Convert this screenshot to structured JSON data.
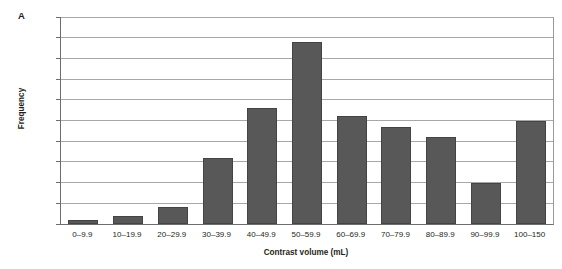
{
  "panel": {
    "letter": "A"
  },
  "chart_data": {
    "type": "bar",
    "title": "",
    "xlabel": "Contrast volume (mL)",
    "ylabel": "Frequency",
    "categories": [
      "0–9.9",
      "10–19.9",
      "20–29.9",
      "30–39.9",
      "40–49.9",
      "50–59.9",
      "60–69.9",
      "70–79.9",
      "80–89.9",
      "90–99.9",
      "100–150"
    ],
    "values": [
      1,
      2,
      4,
      16,
      28,
      44,
      26,
      23.5,
      21,
      10,
      25
    ],
    "ylim": [
      0,
      50
    ],
    "yticks": [
      0,
      5,
      10,
      15,
      20,
      25,
      30,
      35,
      40,
      45,
      50
    ],
    "ytick_labels": [
      "0",
      "5",
      "10",
      "15",
      "20",
      "25",
      "30",
      "35",
      "40",
      "45",
      "50"
    ],
    "grid": true,
    "legend": false,
    "bar_color": "#585858",
    "bar_edge_color": "#444444",
    "grid_color": "#a8a8a8",
    "axis_color": "#6d6d6d"
  }
}
